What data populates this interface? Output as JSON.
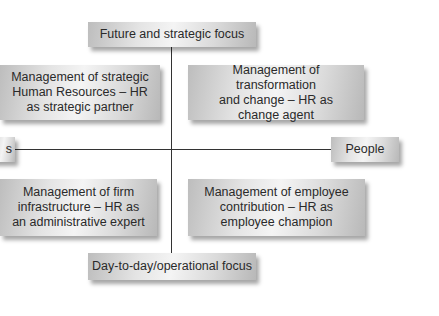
{
  "diagram": {
    "axes": {
      "top": "Future and strategic focus",
      "bottom": "Day-to-day/operational focus",
      "left": "s",
      "right": "People"
    },
    "quadrants": {
      "top_left": [
        "Management of strategic",
        "Human Resources – HR",
        "as strategic partner"
      ],
      "top_right": [
        "Management of transformation",
        "and change – HR as",
        "change agent"
      ],
      "bottom_left": [
        "Management of firm",
        "infrastructure – HR as",
        "an administrative expert"
      ],
      "bottom_right": [
        "Management of employee",
        "contribution – HR as",
        "employee champion"
      ]
    }
  }
}
